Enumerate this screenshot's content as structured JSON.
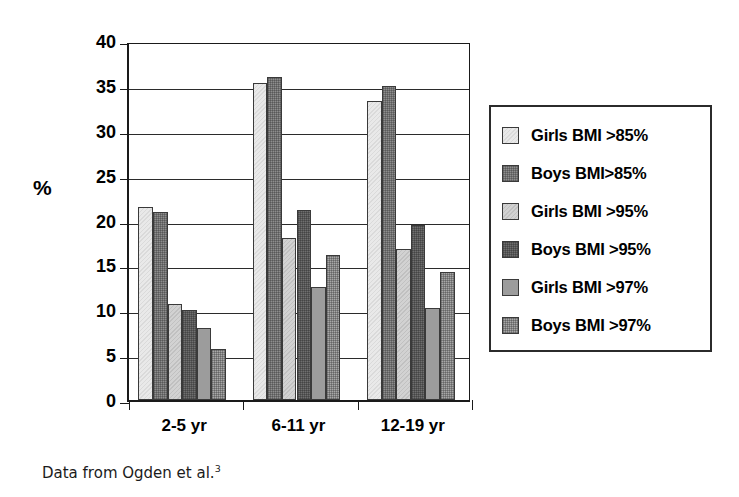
{
  "chart_data": {
    "type": "bar",
    "title": "",
    "subtitle": "",
    "xlabel": "",
    "ylabel": "%",
    "ylim": [
      0,
      40
    ],
    "ytick_step": 5,
    "yticks": [
      40,
      35,
      30,
      25,
      20,
      15,
      10,
      5,
      0
    ],
    "grid": true,
    "legend_position": "right",
    "categories": [
      "2-5 yr",
      "6-11 yr",
      "12-19 yr"
    ],
    "series": [
      {
        "name": "Girls BMI >85%",
        "values": [
          21.5,
          35.3,
          33.3
        ],
        "color": "#e9e9e9"
      },
      {
        "name": "Boys BMI>85%",
        "values": [
          21.0,
          36.0,
          35.0
        ],
        "color": "#8e8e8e"
      },
      {
        "name": "Girls BMI >95%",
        "values": [
          10.7,
          18.0,
          16.8
        ],
        "color": "#d2d2d2"
      },
      {
        "name": "Boys BMI >95%",
        "values": [
          10.0,
          21.2,
          19.5
        ],
        "color": "#6f6f6f"
      },
      {
        "name": "Girls BMI >97%",
        "values": [
          8.0,
          12.6,
          10.3
        ],
        "color": "#9c9c9c"
      },
      {
        "name": "Boys BMI >97%",
        "values": [
          5.7,
          16.2,
          14.3
        ],
        "color": "#a8a8a8"
      }
    ],
    "annotations": [
      "Data from Ogden et al.3"
    ]
  },
  "legend": {
    "items": [
      {
        "label": "Girls BMI >85%"
      },
      {
        "label": "Boys BMI>85%"
      },
      {
        "label": "Girls BMI >95%"
      },
      {
        "label": "Boys BMI >95%"
      },
      {
        "label": "Girls BMI >97%"
      },
      {
        "label": "Boys BMI >97%"
      }
    ]
  },
  "caption": {
    "text": "Data from Ogden et al.",
    "superscript": "3"
  }
}
